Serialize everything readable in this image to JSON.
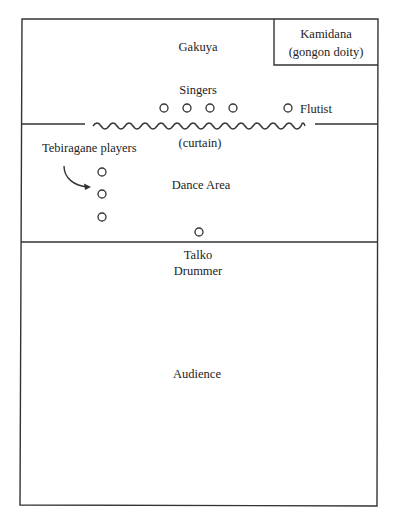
{
  "diagram": {
    "type": "stage-layout",
    "colors": {
      "ink": "#333333",
      "background": "#ffffff"
    },
    "regions": {
      "gakuya": "Gakuya",
      "kamidana_line1": "Kamidana",
      "kamidana_line2": "(gongon doity)",
      "dance_area": "Dance Area",
      "audience": "Audience",
      "curtain": "(curtain)"
    },
    "performers": {
      "singers_label": "Singers",
      "singers_count": 4,
      "flutist_label": "Flutist",
      "tebiragane_label": "Tebiragane players",
      "tebiragane_count": 3,
      "drummer_line1": "Talko",
      "drummer_line2": "Drummer"
    }
  }
}
